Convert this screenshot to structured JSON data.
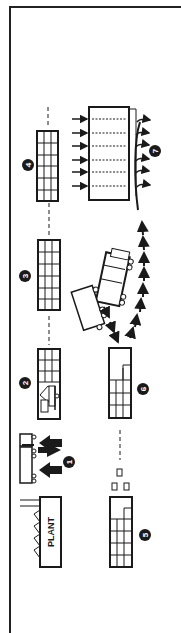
{
  "diagram": {
    "type": "process-flow",
    "orientation": "rotated-90",
    "nodes": [
      {
        "id": "plant",
        "label": "PLANT"
      },
      {
        "id": "step-1",
        "number": "1",
        "description": "truck delivery with arrows"
      },
      {
        "id": "step-2",
        "number": "2",
        "description": "rack partially loaded with forklift"
      },
      {
        "id": "step-3",
        "number": "3",
        "description": "storage rack"
      },
      {
        "id": "step-4",
        "number": "4",
        "description": "storage rack"
      },
      {
        "id": "step-5",
        "number": "5",
        "description": "rack with boxes"
      },
      {
        "id": "step-6",
        "number": "6",
        "description": "rack partially filled"
      },
      {
        "id": "step-7",
        "number": "7",
        "description": "large loading area with outgoing arrows"
      }
    ],
    "labels": {
      "plant": "PLANT",
      "n1": "1",
      "n2": "2",
      "n3": "3",
      "n4": "4",
      "n5": "5",
      "n6": "6",
      "n7": "7"
    },
    "colors": {
      "ink": "#1a1a1a",
      "paper": "#ffffff"
    }
  }
}
